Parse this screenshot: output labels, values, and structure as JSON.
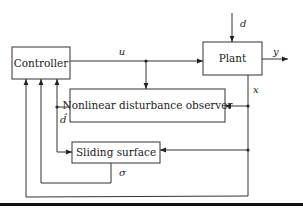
{
  "diagram": {
    "type": "block-diagram",
    "blocks": {
      "controller": {
        "label": "Controller"
      },
      "plant": {
        "label": "Plant"
      },
      "observer": {
        "label": "Nonlinear disturbance observer"
      },
      "sliding": {
        "label": "Sliding surface"
      }
    },
    "signals": {
      "u": "u",
      "d": "d",
      "y": "y",
      "x": "x",
      "d_hat": "d̂",
      "sigma": "σ"
    },
    "connections": [
      {
        "from": "controller",
        "to": "plant",
        "label": "u"
      },
      {
        "from": "u-junction",
        "to": "observer",
        "label": ""
      },
      {
        "from": "external",
        "to": "plant",
        "label": "d"
      },
      {
        "from": "plant",
        "to": "output",
        "label": "y"
      },
      {
        "from": "plant",
        "to": "observer",
        "label": "x"
      },
      {
        "from": "plant",
        "to": "sliding",
        "label": "x"
      },
      {
        "from": "plant",
        "to": "controller",
        "label": "x"
      },
      {
        "from": "observer",
        "to": "controller",
        "label": "d̂"
      },
      {
        "from": "observer",
        "to": "sliding",
        "label": "d̂"
      },
      {
        "from": "sliding",
        "to": "controller",
        "label": "σ"
      }
    ],
    "colors": {
      "stroke": "#333333",
      "background": "#ffffff",
      "rule": "#111111"
    }
  }
}
